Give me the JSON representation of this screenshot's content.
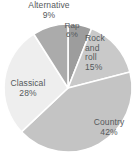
{
  "chart_data": {
    "type": "pie",
    "title": "",
    "subtitle": "",
    "xlabel": "",
    "ylabel": "",
    "legend_position": "none",
    "grid": false,
    "start_angle_deg": 0,
    "direction": "clockwise",
    "categories": [
      "Rap",
      "Rock and roll",
      "Country",
      "Classical",
      "Alternative"
    ],
    "values": [
      6,
      15,
      42,
      28,
      9
    ],
    "unit": "%",
    "total": 100,
    "slices": [
      {
        "label": "Rap",
        "value": 6,
        "value_text": "6%",
        "color": "#9d9d9d",
        "label_lines": [
          "Rap",
          "6%"
        ]
      },
      {
        "label": "Rock and roll",
        "value": 15,
        "value_text": "15%",
        "color": "#c9c9c9",
        "label_lines": [
          "Rock",
          "and",
          "roll",
          "15%"
        ]
      },
      {
        "label": "Country",
        "value": 42,
        "value_text": "42%",
        "color": "#c4c4c4",
        "label_lines": [
          "Country",
          "42%"
        ]
      },
      {
        "label": "Classical",
        "value": 28,
        "value_text": "28%",
        "color": "#eeeeee",
        "label_lines": [
          "Classical",
          "28%"
        ]
      },
      {
        "label": "Alternative",
        "value": 9,
        "value_text": "9%",
        "color": "#ababab",
        "label_lines": [
          "Alternative",
          "9%"
        ]
      }
    ]
  },
  "labels": {
    "alternative": {
      "name": "Alternative",
      "pct": "9%"
    },
    "rap": {
      "name": "Rap",
      "pct": "6%"
    },
    "rock": {
      "line1": "Rock",
      "line2": "and",
      "line3": "roll",
      "pct": "15%"
    },
    "country": {
      "name": "Country",
      "pct": "42%"
    },
    "classical": {
      "name": "Classical",
      "pct": "28%"
    }
  },
  "colors": {
    "background": "#ffffff",
    "separator": "#ffffff",
    "text": "#55595c",
    "rap": "#9d9d9d",
    "rock": "#c9c9c9",
    "country": "#c4c4c4",
    "classical": "#eeeeee",
    "alternative": "#ababab"
  },
  "geometry": {
    "center_x": 68,
    "center_y": 88,
    "radius": 64
  }
}
